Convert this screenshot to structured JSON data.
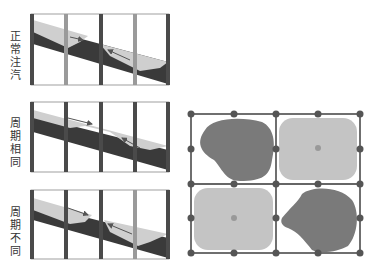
{
  "panels": [
    {
      "label": "正常注汽",
      "chars": [
        "正",
        "常",
        "注",
        "汽"
      ],
      "bars": [
        "dark",
        "light",
        "dark",
        "light",
        "dark"
      ]
    },
    {
      "label": "周期相同",
      "chars": [
        "周",
        "期",
        "相",
        "同"
      ],
      "bars": [
        "dark",
        "dark",
        "dark",
        "dark",
        "dark"
      ]
    },
    {
      "label": "周期不同",
      "chars": [
        "周",
        "期",
        "不",
        "同"
      ],
      "bars": [
        "dark",
        "dark",
        "dark",
        "light",
        "dark"
      ]
    }
  ],
  "grid": {
    "cells": [
      {
        "position": "top-left",
        "shape": "irregular",
        "tone": "dark"
      },
      {
        "position": "top-right",
        "shape": "rounded-square",
        "tone": "light",
        "center_dot": true
      },
      {
        "position": "bottom-left",
        "shape": "rounded-square",
        "tone": "light",
        "center_dot": true
      },
      {
        "position": "bottom-right",
        "shape": "irregular",
        "tone": "dark"
      }
    ]
  },
  "colors": {
    "dark_bar": "#4a4a4a",
    "light_bar": "#9a9a9a",
    "steam": "#cfcfcf",
    "dark_layer": "#3a3a3a",
    "blob_dark": "#7a7a7a",
    "blob_light": "#c4c4c4",
    "node": "#555555"
  }
}
